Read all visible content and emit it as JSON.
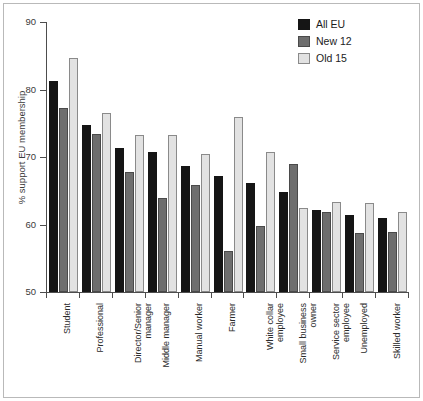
{
  "chart_data": {
    "type": "bar",
    "title": "",
    "subtitle": "",
    "xlabel": "",
    "ylabel": "% support EU membership",
    "ylim": [
      50,
      90
    ],
    "yticks": [
      50,
      60,
      70,
      80,
      90
    ],
    "grid": false,
    "legend_position": "top-right",
    "categories": [
      "Student",
      "Professional",
      "Director/Senior manager",
      "Middle manager",
      "Manual worker",
      "Farmer",
      "White collar employee",
      "Small business owner",
      "Service sector employee",
      "Unemployed",
      "Skilled worker"
    ],
    "category_lines": [
      [
        "Student"
      ],
      [
        "Professional"
      ],
      [
        "Director/Senior",
        "manager"
      ],
      [
        "Middle manager"
      ],
      [
        "Manual worker"
      ],
      [
        "Farmer"
      ],
      [
        "White collar",
        "employee"
      ],
      [
        "Small business",
        "owner"
      ],
      [
        "Service sector",
        "employee"
      ],
      [
        "Unemployed"
      ],
      [
        "Skilled worker"
      ]
    ],
    "series": [
      {
        "name": "All EU",
        "color": "#151515",
        "values": [
          81.2,
          74.8,
          71.4,
          70.7,
          68.6,
          67.2,
          66.2,
          64.8,
          62.2,
          61.4,
          60.9
        ]
      },
      {
        "name": "New 12",
        "color": "#6e6e6e",
        "values": [
          77.2,
          73.4,
          67.8,
          64.0,
          65.9,
          56.1,
          59.8,
          69.0,
          61.8,
          58.7,
          58.9
        ]
      },
      {
        "name": "Old 15",
        "color": "#e2e2e2",
        "values": [
          84.6,
          76.5,
          73.3,
          73.3,
          70.5,
          75.9,
          70.8,
          62.5,
          63.4,
          63.2,
          61.9
        ]
      }
    ]
  },
  "legend": {
    "items": [
      {
        "label": "All EU"
      },
      {
        "label": "New 12"
      },
      {
        "label": "Old 15"
      }
    ]
  },
  "colors": {
    "series_all_eu": "#151515",
    "series_new_12": "#6e6e6e",
    "series_old_15": "#e2e2e2",
    "axis": "#4d4d4d",
    "frame": "#b9b9b9",
    "background": "#ffffff"
  }
}
